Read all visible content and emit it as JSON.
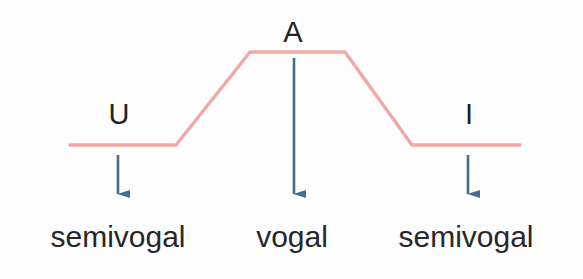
{
  "figure": {
    "title": "",
    "background_color": "#fdfdfd",
    "curve_color": "#f0aaa5",
    "arrow_color": "#466b8e",
    "text_color": "#272727"
  },
  "peaks": [
    {
      "id": "u",
      "label": "U",
      "name": "peak-label-u"
    },
    {
      "id": "a",
      "label": "A",
      "name": "peak-label-a"
    },
    {
      "id": "i",
      "label": "I",
      "name": "peak-label-i"
    }
  ],
  "classes": [
    {
      "id": "left",
      "label": "semivogal"
    },
    {
      "id": "center",
      "label": "vogal"
    },
    {
      "id": "right",
      "label": "semivogal"
    }
  ],
  "chart_data": {
    "type": "line",
    "title": "",
    "xlabel": "",
    "ylabel": "",
    "grid": false,
    "legend": null,
    "series": [
      {
        "name": "sonority-contour",
        "color": "#f0aaa5",
        "points": [
          {
            "x": 70,
            "y": 145
          },
          {
            "x": 176,
            "y": 145
          },
          {
            "x": 250,
            "y": 52
          },
          {
            "x": 345,
            "y": 52
          },
          {
            "x": 412,
            "y": 145
          },
          {
            "x": 520,
            "y": 145
          }
        ]
      }
    ],
    "annotations": [
      {
        "label": "U",
        "x": 118,
        "y": 120,
        "arrow_from_y": 155,
        "arrow_to_y": 205
      },
      {
        "label": "A",
        "x": 294,
        "y": 35,
        "arrow_from_y": 58,
        "arrow_to_y": 205
      },
      {
        "label": "I",
        "x": 468,
        "y": 120,
        "arrow_from_y": 155,
        "arrow_to_y": 205
      }
    ],
    "categories": [
      "semivogal",
      "vogal",
      "semivogal"
    ],
    "values": [
      1,
      3,
      1
    ]
  }
}
